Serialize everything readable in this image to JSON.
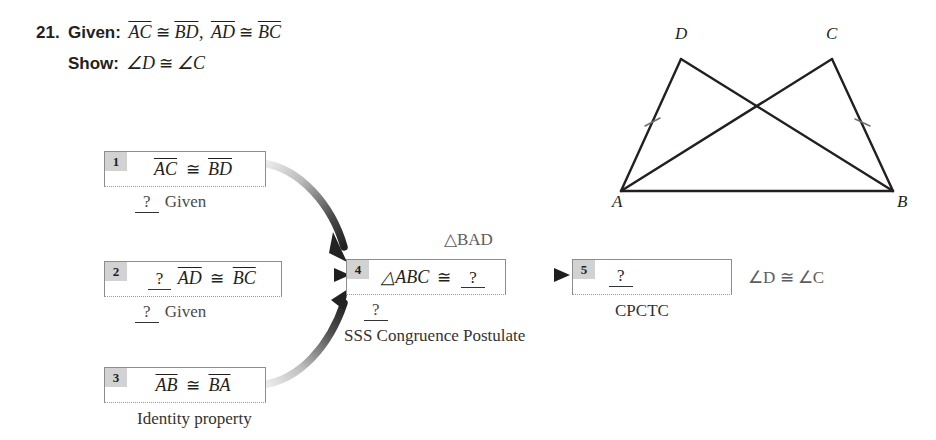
{
  "problem": {
    "number": "21.",
    "given_label": "Given:",
    "given_parts": {
      "seg1": "AC",
      "cong1": "≅",
      "seg2": "BD",
      "comma": ",",
      "seg3": "AD",
      "cong2": "≅",
      "seg4": "BC"
    },
    "show_label": "Show:",
    "show_parts": {
      "angle1": "∠D",
      "cong": "≅",
      "angle2": "∠C"
    }
  },
  "flowchart": {
    "boxes": [
      {
        "num": "1",
        "blank_before": "",
        "statement_left": "AC",
        "cong": "≅",
        "statement_right": "BD",
        "blank_after": "",
        "reason_blank": "?",
        "reason": "Given"
      },
      {
        "num": "2",
        "blank_before": "?",
        "statement_left": "AD",
        "cong": "≅",
        "statement_right": "BC",
        "blank_after": "",
        "reason_blank": "?",
        "reason": "Given"
      },
      {
        "num": "3",
        "blank_before": "",
        "statement_left": "AB",
        "cong": "≅",
        "statement_right": "BA",
        "blank_after": "",
        "reason_blank": "",
        "reason": "Identity property"
      },
      {
        "num": "4",
        "statement_left": "△ABC",
        "cong": "≅",
        "blank_after": "?",
        "answer_above": "△BAD",
        "reason_blank": "?",
        "reason": "SSS Congruence Postulate"
      },
      {
        "num": "5",
        "blank_inside": "?",
        "answer_right": "∠D ≅ ∠C",
        "reason": "CPCTC"
      }
    ]
  },
  "figure": {
    "vertices": [
      {
        "label": "A",
        "x": 621,
        "y": 191,
        "lx": 612,
        "ly": 196
      },
      {
        "label": "B",
        "x": 893,
        "y": 191,
        "lx": 897,
        "ly": 196
      },
      {
        "label": "C",
        "x": 832,
        "y": 59,
        "lx": 826,
        "ly": 24
      },
      {
        "label": "D",
        "x": 681,
        "y": 59,
        "lx": 675,
        "ly": 24
      }
    ],
    "segments": [
      {
        "from": "A",
        "to": "B"
      },
      {
        "from": "A",
        "to": "D"
      },
      {
        "from": "D",
        "to": "B"
      },
      {
        "from": "A",
        "to": "C"
      },
      {
        "from": "C",
        "to": "B"
      }
    ],
    "tick_marks": [
      {
        "on": "AD",
        "x": 652,
        "y": 122
      },
      {
        "on": "BC",
        "x": 862,
        "y": 122
      }
    ]
  },
  "colors": {
    "ink": "#231f20",
    "box_border": "#8d8d8d",
    "num_tab": "#d2d2d2",
    "caption": "#4a4a4a",
    "arrow_dark": "#2b2b2b",
    "arrow_light": "#e8e8e8"
  }
}
